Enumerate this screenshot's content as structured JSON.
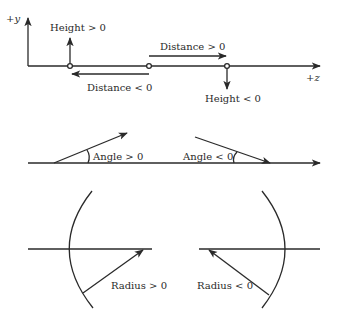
{
  "sign_convention_diagram": {
    "panel_distance_height": {
      "y_axis_label": "+y",
      "z_axis_label": "+z",
      "height_positive": "Height > 0",
      "height_negative": "Height < 0",
      "distance_positive": "Distance > 0",
      "distance_negative": "Distance < 0"
    },
    "panel_angle": {
      "angle_positive": "Angle > 0",
      "angle_negative": "Angle < 0"
    },
    "panel_radius": {
      "radius_positive": "Radius > 0",
      "radius_negative": "Radius < 0"
    },
    "colors": {
      "line": "#2a2a2a",
      "background": "#ffffff"
    }
  }
}
